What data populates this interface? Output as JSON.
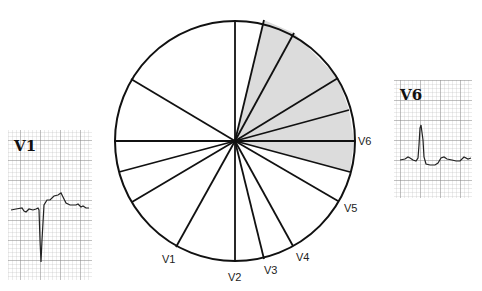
{
  "diagram": {
    "center": [
      235,
      141
    ],
    "radius": 120,
    "shade_color": "#dcdcdc",
    "line_color": "#111111",
    "spokes": [
      {
        "x": 235,
        "y": 21
      },
      {
        "x": 264,
        "y": 20
      },
      {
        "x": 294,
        "y": 33
      },
      {
        "x": 338,
        "y": 78
      },
      {
        "x": 349,
        "y": 110
      },
      {
        "x": 354,
        "y": 141
      },
      {
        "x": 350,
        "y": 172
      },
      {
        "x": 338,
        "y": 201
      },
      {
        "x": 293,
        "y": 246
      },
      {
        "x": 264,
        "y": 259
      },
      {
        "x": 235,
        "y": 262
      },
      {
        "x": 176,
        "y": 247
      },
      {
        "x": 132,
        "y": 202
      },
      {
        "x": 119,
        "y": 172
      },
      {
        "x": 114,
        "y": 141
      },
      {
        "x": 131,
        "y": 79
      }
    ],
    "shaded_polygon": "235,141 264,20 294,33 338,78 349,110 354,141 350,172",
    "lead_labels": [
      {
        "text": "V6",
        "x": 358,
        "y": 145
      },
      {
        "text": "V5",
        "x": 344,
        "y": 212
      },
      {
        "text": "V4",
        "x": 296,
        "y": 261
      },
      {
        "text": "V3",
        "x": 264,
        "y": 274
      },
      {
        "text": "V2",
        "x": 228,
        "y": 281
      },
      {
        "text": "V1",
        "x": 162,
        "y": 263
      }
    ]
  },
  "strips": {
    "v1": {
      "title": "V1",
      "x": 8,
      "y": 130,
      "w": 84,
      "h": 150
    },
    "v6": {
      "title": "V6",
      "x": 394,
      "y": 80,
      "w": 78,
      "h": 118
    }
  }
}
